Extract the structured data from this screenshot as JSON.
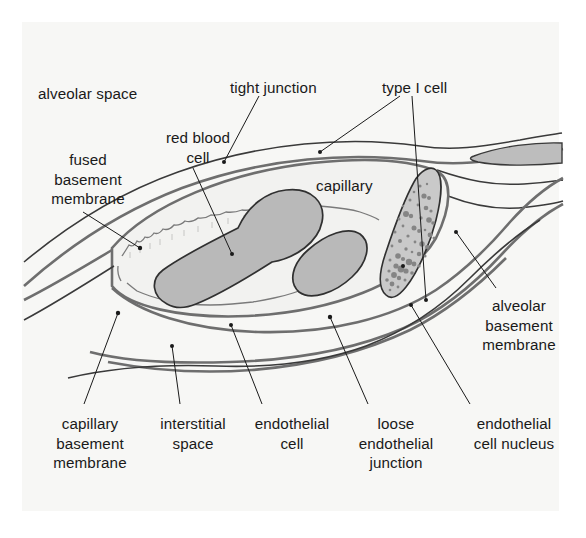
{
  "figure": {
    "background_color": "#ffffff",
    "panel_color": "#f7f7f5",
    "ink_color": "#1a1a1a",
    "membrane_color": "#6e6e6e",
    "rbc_fill": "#b9b9b9",
    "nucleus_fill": "#c9c9c9",
    "nucleus_speckle": "#8a8a8a",
    "capillary_lumen_fill": "#f2f2f0"
  },
  "labels": [
    {
      "id": "alveolar-space",
      "lines": [
        "alveolar space"
      ],
      "x": 38,
      "y": 84,
      "align": "l"
    },
    {
      "id": "tight-junction",
      "lines": [
        "tight junction"
      ],
      "x": 230,
      "y": 78,
      "align": "l"
    },
    {
      "id": "type-i-cell",
      "lines": [
        "type I cell"
      ],
      "x": 382,
      "y": 78,
      "align": "l"
    },
    {
      "id": "red-blood-cell",
      "lines": [
        "red blood",
        "cell"
      ],
      "x": 150,
      "y": 128,
      "align": "c",
      "width": 96
    },
    {
      "id": "fused-basement-membrane",
      "lines": [
        "fused",
        "basement",
        "membrane"
      ],
      "x": 32,
      "y": 150,
      "align": "c",
      "width": 112
    },
    {
      "id": "capillary",
      "lines": [
        "capillary"
      ],
      "x": 316,
      "y": 176,
      "align": "l"
    },
    {
      "id": "alveolar-basement-membrane",
      "lines": [
        "alveolar",
        "basement",
        "membrane"
      ],
      "x": 464,
      "y": 296,
      "align": "c",
      "width": 110
    },
    {
      "id": "capillary-basement-membrane",
      "lines": [
        "capillary",
        "basement",
        "membrane"
      ],
      "x": 36,
      "y": 414,
      "align": "c",
      "width": 108
    },
    {
      "id": "interstitial-space",
      "lines": [
        "interstitial",
        "space"
      ],
      "x": 146,
      "y": 414,
      "align": "c",
      "width": 94
    },
    {
      "id": "endothelial-cell",
      "lines": [
        "endothelial",
        "cell"
      ],
      "x": 244,
      "y": 414,
      "align": "c",
      "width": 96
    },
    {
      "id": "loose-endothelial-junction",
      "lines": [
        "loose",
        "endothelial",
        "junction"
      ],
      "x": 346,
      "y": 414,
      "align": "c",
      "width": 100
    },
    {
      "id": "endothelial-cell-nucleus",
      "lines": [
        "endothelial",
        "cell nucleus"
      ],
      "x": 456,
      "y": 414,
      "align": "c",
      "width": 116
    }
  ],
  "leader_lines": [
    {
      "id": "leader-tight-junction",
      "from": [
        259,
        96
      ],
      "to": [
        224,
        162
      ],
      "dot": "to"
    },
    {
      "id": "leader-type-i-cell-a",
      "from": [
        400,
        96
      ],
      "to": [
        320,
        152
      ],
      "dot": "to"
    },
    {
      "id": "leader-type-i-cell-b",
      "from": [
        412,
        96
      ],
      "to": [
        426,
        300
      ],
      "dot": "to"
    },
    {
      "id": "leader-red-blood-cell",
      "from": [
        193,
        168
      ],
      "to": [
        232,
        254
      ],
      "dot": "to"
    },
    {
      "id": "leader-fused-basement-membrane",
      "from": [
        83,
        212
      ],
      "to": [
        140,
        248
      ],
      "dot": "to"
    },
    {
      "id": "leader-alveolar-basement-membrane",
      "from": [
        496,
        288
      ],
      "to": [
        456,
        232
      ],
      "dot": "to"
    },
    {
      "id": "leader-capillary-basement-membrane",
      "from": [
        84,
        404
      ],
      "to": [
        118,
        313
      ],
      "dot": "to"
    },
    {
      "id": "leader-interstitial-space",
      "from": [
        180,
        404
      ],
      "to": [
        172,
        346
      ],
      "dot": "to"
    },
    {
      "id": "leader-endothelial-cell",
      "from": [
        262,
        404
      ],
      "to": [
        231,
        325
      ],
      "dot": "to"
    },
    {
      "id": "leader-loose-endothelial-junction",
      "from": [
        368,
        404
      ],
      "to": [
        330,
        317
      ],
      "dot": "to"
    },
    {
      "id": "leader-endothelial-cell-nucleus",
      "from": [
        470,
        404
      ],
      "to": [
        411,
        305
      ],
      "dot": "to"
    }
  ],
  "structures": [
    {
      "id": "alveolar-epithelium-upper",
      "kind": "membrane-pair"
    },
    {
      "id": "alveolar-epithelium-lower",
      "kind": "membrane-pair"
    },
    {
      "id": "capillary-lumen",
      "kind": "lumen"
    },
    {
      "id": "red-blood-cell-large",
      "kind": "rbc"
    },
    {
      "id": "red-blood-cell-small",
      "kind": "rbc"
    },
    {
      "id": "endothelial-nucleus",
      "kind": "nucleus"
    },
    {
      "id": "type-i-cell-nucleus",
      "kind": "nucleus-small"
    },
    {
      "id": "interstitial-membranes",
      "kind": "membrane-pair"
    }
  ]
}
